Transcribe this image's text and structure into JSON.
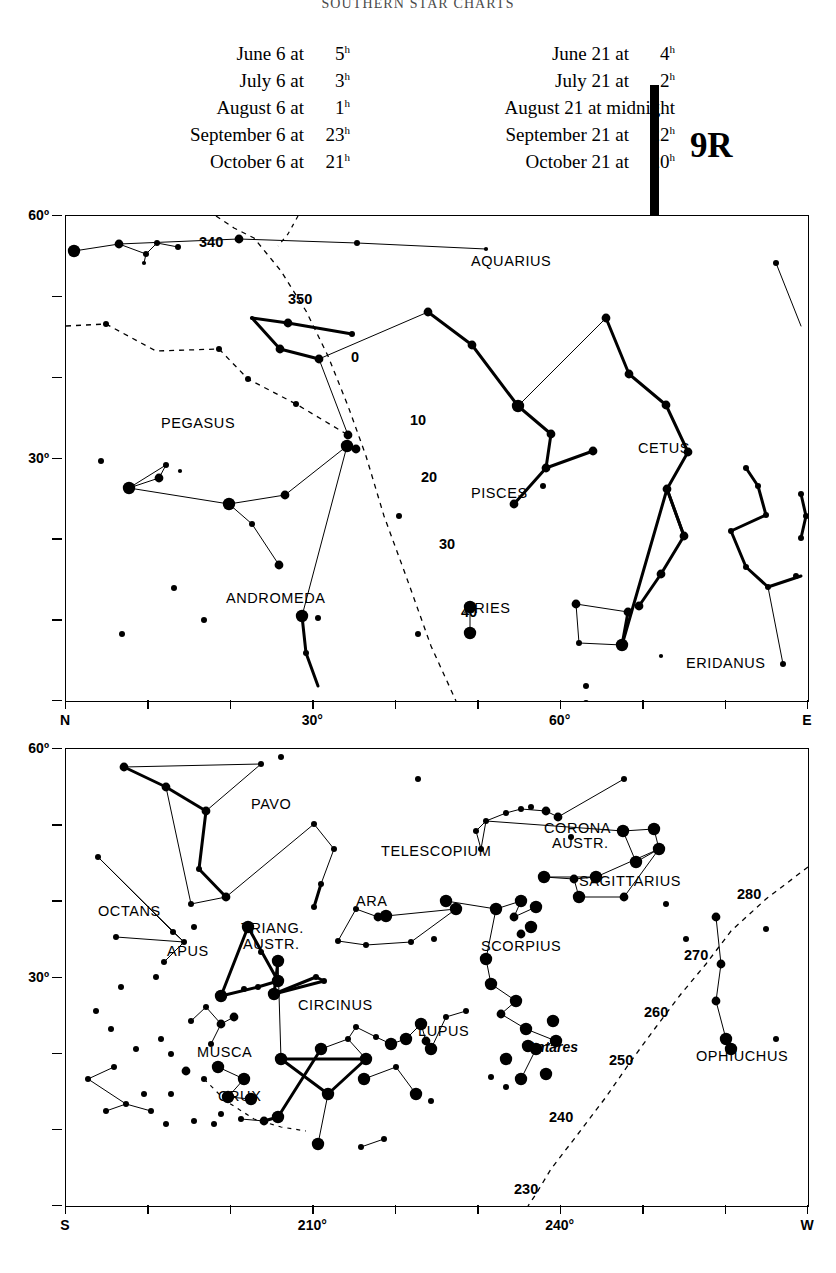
{
  "running_head": "SOUTHERN STAR CHARTS",
  "chart_number": "9R",
  "header": {
    "left_column": [
      {
        "text": "June 6 at",
        "time": "5",
        "sup": "h"
      },
      {
        "text": "July 6 at",
        "time": "3",
        "sup": "h"
      },
      {
        "text": "August 6 at",
        "time": "1",
        "sup": "h"
      },
      {
        "text": "September 6 at",
        "time": "23",
        "sup": "h"
      },
      {
        "text": "October 6 at",
        "time": "21",
        "sup": "h"
      }
    ],
    "right_column": [
      {
        "text": "June 21 at",
        "time": "4",
        "sup": "h"
      },
      {
        "text": "July 21 at",
        "time": "2",
        "sup": "h"
      },
      {
        "text": "August 21 at midnight",
        "time": "",
        "sup": ""
      },
      {
        "text": "September 21 at",
        "time": "22",
        "sup": "h"
      },
      {
        "text": "October 21 at",
        "time": "20",
        "sup": "h"
      }
    ]
  },
  "chart_data": {
    "type": "scatter",
    "panels": [
      {
        "id": "north",
        "name": "Northern horizon panel",
        "xlabel": "",
        "ylabel": "Altitude",
        "xlim": [
          0,
          90
        ],
        "ylim": [
          0,
          67
        ],
        "grid": false,
        "x_ticks": [
          {
            "value": 0,
            "label": "N"
          },
          {
            "value": 10,
            "label": ""
          },
          {
            "value": 20,
            "label": ""
          },
          {
            "value": 30,
            "label": "30°"
          },
          {
            "value": 40,
            "label": ""
          },
          {
            "value": 50,
            "label": ""
          },
          {
            "value": 60,
            "label": "60°"
          },
          {
            "value": 70,
            "label": ""
          },
          {
            "value": 80,
            "label": ""
          },
          {
            "value": 90,
            "label": "E"
          }
        ],
        "y_ticks": [
          {
            "value": 60,
            "label": "60º"
          },
          {
            "value": 50,
            "label": ""
          },
          {
            "value": 40,
            "label": ""
          },
          {
            "value": 30,
            "label": "30º"
          },
          {
            "value": 20,
            "label": ""
          },
          {
            "value": 10,
            "label": ""
          },
          {
            "value": 0,
            "label": ""
          }
        ],
        "constellations": [
          {
            "name": "AQUARIUS",
            "x": 405,
            "y": 38
          },
          {
            "name": "PEGASUS",
            "x": 95,
            "y": 200
          },
          {
            "name": "CETUS",
            "x": 572,
            "y": 225
          },
          {
            "name": "PISCES",
            "x": 405,
            "y": 270
          },
          {
            "name": "ANDROMEDA",
            "x": 160,
            "y": 375
          },
          {
            "name": "ARIES",
            "x": 398,
            "y": 385
          },
          {
            "name": "ERIDANUS",
            "x": 620,
            "y": 440
          }
        ],
        "ecliptic_labels": [
          {
            "value": "340",
            "x": 133,
            "y": 18
          },
          {
            "value": "350",
            "x": 222,
            "y": 75
          },
          {
            "value": "0",
            "x": 285,
            "y": 133
          },
          {
            "value": "10",
            "x": 344,
            "y": 196
          },
          {
            "value": "20",
            "x": 355,
            "y": 253
          },
          {
            "value": "30",
            "x": 373,
            "y": 320
          },
          {
            "value": "40",
            "x": 395,
            "y": 388
          }
        ]
      },
      {
        "id": "south",
        "name": "Southern horizon panel",
        "xlabel": "",
        "ylabel": "Altitude",
        "xlim": [
          180,
          270
        ],
        "ylim": [
          0,
          64
        ],
        "grid": false,
        "x_ticks": [
          {
            "value": 180,
            "label": "S"
          },
          {
            "value": 190,
            "label": ""
          },
          {
            "value": 200,
            "label": ""
          },
          {
            "value": 210,
            "label": "210°"
          },
          {
            "value": 220,
            "label": ""
          },
          {
            "value": 230,
            "label": ""
          },
          {
            "value": 240,
            "label": "240°"
          },
          {
            "value": 250,
            "label": ""
          },
          {
            "value": 260,
            "label": ""
          },
          {
            "value": 270,
            "label": "W"
          }
        ],
        "y_ticks": [
          {
            "value": 60,
            "label": "60º"
          },
          {
            "value": 50,
            "label": ""
          },
          {
            "value": 40,
            "label": ""
          },
          {
            "value": 30,
            "label": "30º"
          },
          {
            "value": 20,
            "label": ""
          },
          {
            "value": 10,
            "label": ""
          },
          {
            "value": 0,
            "label": ""
          }
        ],
        "constellations": [
          {
            "name": "PAVO",
            "x": 185,
            "y": 48
          },
          {
            "name": "TELESCOPIUM",
            "x": 315,
            "y": 95
          },
          {
            "name": "CORONA",
            "x": 478,
            "y": 72
          },
          {
            "name": "AUSTR.",
            "x": 486,
            "y": 87
          },
          {
            "name": "SAGITTARIUS",
            "x": 513,
            "y": 125
          },
          {
            "name": "OCTANS",
            "x": 32,
            "y": 155
          },
          {
            "name": "ARA",
            "x": 290,
            "y": 145
          },
          {
            "name": "TRIANG.",
            "x": 175,
            "y": 172
          },
          {
            "name": "AUSTR.",
            "x": 177,
            "y": 188
          },
          {
            "name": "APUS",
            "x": 101,
            "y": 195
          },
          {
            "name": "SCORPIUS",
            "x": 415,
            "y": 190
          },
          {
            "name": "CIRCINUS",
            "x": 232,
            "y": 249
          },
          {
            "name": "LUPUS",
            "x": 352,
            "y": 275
          },
          {
            "name": "MUSCA",
            "x": 131,
            "y": 296
          },
          {
            "name": "OPHIUCHUS",
            "x": 630,
            "y": 300
          },
          {
            "name": "CRUX",
            "x": 152,
            "y": 340
          }
        ],
        "star_labels": [
          {
            "name": "Antares",
            "x": 460,
            "y": 290
          }
        ],
        "ecliptic_labels": [
          {
            "value": "280",
            "x": 671,
            "y": 137
          },
          {
            "value": "270",
            "x": 618,
            "y": 198
          },
          {
            "value": "260",
            "x": 578,
            "y": 255
          },
          {
            "value": "250",
            "x": 543,
            "y": 303
          },
          {
            "value": "240",
            "x": 483,
            "y": 360
          },
          {
            "value": "230",
            "x": 448,
            "y": 432
          }
        ]
      }
    ],
    "legend": []
  }
}
